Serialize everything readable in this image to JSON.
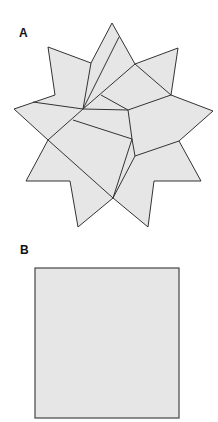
{
  "panels": [
    {
      "label": "A",
      "shape": "nine-pointed star dissected into pieces"
    },
    {
      "label": "B",
      "shape": "square"
    }
  ],
  "colors": {
    "fill": "#e6e6e6",
    "stroke": "#333333",
    "background": "#ffffff"
  },
  "star": {
    "outline": "112,23 135,64 178,48 171,95 213,111 179,141 201,181 154,181 148,227 113,198 78,227 70,181 26,181 48,140 14,109 55,95 48,47 91,63",
    "cuts": [
      [
        83,
        109,
        91,
        63
      ],
      [
        83,
        109,
        119,
        37
      ],
      [
        83,
        109,
        135,
        64
      ],
      [
        101,
        95,
        128,
        110
      ],
      [
        135,
        64,
        171,
        95
      ],
      [
        83,
        109,
        128,
        110
      ],
      [
        128,
        110,
        171,
        95
      ],
      [
        128,
        110,
        132,
        139
      ],
      [
        33,
        102,
        83,
        109
      ],
      [
        83,
        109,
        48,
        140
      ],
      [
        73,
        120,
        132,
        139
      ],
      [
        48,
        140,
        113,
        198
      ],
      [
        132,
        139,
        113,
        198
      ],
      [
        132,
        139,
        135,
        156
      ],
      [
        135,
        156,
        179,
        141
      ],
      [
        135,
        156,
        113,
        198
      ]
    ]
  },
  "square": {
    "x": 35,
    "y": 268,
    "width": 144,
    "height": 150
  }
}
